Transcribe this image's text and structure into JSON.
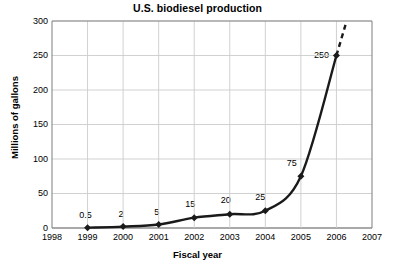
{
  "chart_data": {
    "type": "line",
    "title": "U.S. biodiesel production",
    "xlabel": "Fiscal year",
    "ylabel": "Millions of gallons",
    "x": [
      1999,
      2000,
      2001,
      2002,
      2003,
      2004,
      2005,
      2006
    ],
    "values": [
      0.5,
      2,
      5,
      15,
      20,
      25,
      75,
      250
    ],
    "point_labels": [
      "0.5",
      "2",
      "5",
      "15",
      "20",
      "25",
      "75",
      "250"
    ],
    "xlim": [
      1998,
      2007
    ],
    "ylim": [
      0,
      300
    ],
    "xticks": [
      "1998",
      "1999",
      "2000",
      "2001",
      "2002",
      "2003",
      "2004",
      "2005",
      "2006",
      "2007"
    ],
    "yticks": [
      "0",
      "50",
      "100",
      "150",
      "200",
      "250",
      "300"
    ],
    "grid": true,
    "legend": false,
    "series_color": "#1a1a1a",
    "grid_color": "#cccccc",
    "marker": "diamond",
    "projection": {
      "style": "dashed",
      "from_x": 2006,
      "from_y": 250,
      "to_y": 320,
      "note": "dashed trend extension beyond 2006 past top of axis"
    }
  }
}
